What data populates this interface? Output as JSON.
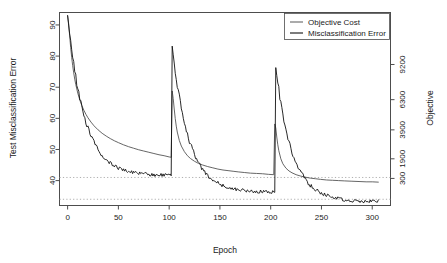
{
  "chart_data": {
    "type": "line",
    "title": "",
    "xlabel": "Epoch",
    "ylabel": "Test Misclassification Error",
    "ylabel_right": "Objective",
    "xlim": [
      -8,
      318
    ],
    "ylim": [
      32.0,
      94.0
    ],
    "grid": false,
    "xticks": [
      0,
      50,
      100,
      150,
      200,
      250,
      300
    ],
    "xticklabels": [
      "0",
      "50",
      "100",
      "150",
      "200",
      "250",
      "300"
    ],
    "yticks": [
      40,
      50,
      60,
      70,
      80,
      90
    ],
    "yticklabels": [
      "40",
      "50",
      "60",
      "70",
      "80",
      "90"
    ],
    "right_axis": {
      "label": "Objective",
      "ticks": [
        300,
        1900,
        3900,
        6300,
        9200
      ],
      "ticklabels": [
        "300",
        "1900",
        "3900",
        "6300",
        "9200"
      ],
      "tick_left_positions": [
        40.7,
        47.0,
        56.3,
        66.0,
        77.3
      ]
    },
    "reference_lines": [
      {
        "name": "upper-reference",
        "y": 41.0,
        "style": "dotted",
        "color": "#9a9a9a"
      },
      {
        "name": "lower-reference",
        "y": 34.0,
        "style": "dotted",
        "color": "#9a9a9a"
      }
    ],
    "legend": {
      "position": "top-right",
      "entries": [
        {
          "label": "Objective Cost",
          "color": "#666666"
        },
        {
          "label": "Misclassification Error",
          "color": "#111111"
        }
      ]
    },
    "series": [
      {
        "name": "Objective Cost",
        "color": "#666666",
        "x": [
          0,
          1,
          2,
          3,
          4,
          5,
          6,
          7,
          8,
          10,
          12,
          14,
          16,
          18,
          20,
          23,
          26,
          30,
          34,
          38,
          42,
          46,
          50,
          55,
          60,
          65,
          70,
          75,
          80,
          85,
          90,
          95,
          100,
          102,
          103,
          104,
          105,
          106,
          107,
          108,
          110,
          112,
          115,
          118,
          121,
          125,
          129,
          133,
          138,
          143,
          148,
          153,
          158,
          163,
          168,
          174,
          180,
          186,
          192,
          198,
          203,
          204,
          205,
          206,
          207,
          208,
          210,
          212,
          215,
          218,
          221,
          225,
          229,
          234,
          239,
          244,
          249,
          255,
          261,
          267,
          273,
          280,
          287,
          294,
          300,
          306
        ],
        "y": [
          93.0,
          90.5,
          86.5,
          82.8,
          79.6,
          76.9,
          74.6,
          72.6,
          70.9,
          68.1,
          65.9,
          64.1,
          62.6,
          61.3,
          60.2,
          58.8,
          57.6,
          56.3,
          55.2,
          54.3,
          53.5,
          52.8,
          52.2,
          51.5,
          50.9,
          50.4,
          49.9,
          49.5,
          49.1,
          48.7,
          48.3,
          48.0,
          47.6,
          47.5,
          68.8,
          66.3,
          63.0,
          59.9,
          57.5,
          55.6,
          52.9,
          51.1,
          49.3,
          48.0,
          47.1,
          46.2,
          45.5,
          45.0,
          44.5,
          44.1,
          43.7,
          43.4,
          43.2,
          43.0,
          42.8,
          42.6,
          42.4,
          42.3,
          42.2,
          42.0,
          41.9,
          58.2,
          56.9,
          54.0,
          51.5,
          49.6,
          47.0,
          45.4,
          44.0,
          43.1,
          42.5,
          41.9,
          41.5,
          41.1,
          40.8,
          40.6,
          40.4,
          40.2,
          40.1,
          40.0,
          39.9,
          39.8,
          39.7,
          39.6,
          39.6,
          39.5
        ],
        "axis": "right"
      },
      {
        "name": "Misclassification Error",
        "color": "#111111",
        "description": "noisy decreasing test error with restarts at epochs 103 and 205",
        "axis": "left",
        "segments": [
          {
            "start_epoch": 0,
            "end_epoch": 102,
            "start_value": 93.0,
            "end_value": 41.6,
            "spike": null
          },
          {
            "start_epoch": 103,
            "end_epoch": 204,
            "start_value": 83.2,
            "end_value": 36.2,
            "spike": 83.2
          },
          {
            "start_epoch": 205,
            "end_epoch": 306,
            "start_value": 76.3,
            "end_value": 33.2,
            "spike": 76.3
          }
        ],
        "noise_amplitude": 0.55
      }
    ],
    "annotations": [
      {
        "text": "restart spike",
        "epoch": 103,
        "value": 83.2
      },
      {
        "text": "restart spike",
        "epoch": 205,
        "value": 76.3
      }
    ]
  },
  "axes": {
    "x_label": "Epoch",
    "y_label_left": "Test Misclassification Error",
    "y_label_right": "Objective"
  },
  "legend": {
    "item_objective": "Objective Cost",
    "item_misclass": "Misclassification Error"
  },
  "colors": {
    "objective": "#666666",
    "misclassification": "#111111",
    "reference_line": "#9a9a9a",
    "axis": "#4d4d4d",
    "background": "#ffffff"
  }
}
